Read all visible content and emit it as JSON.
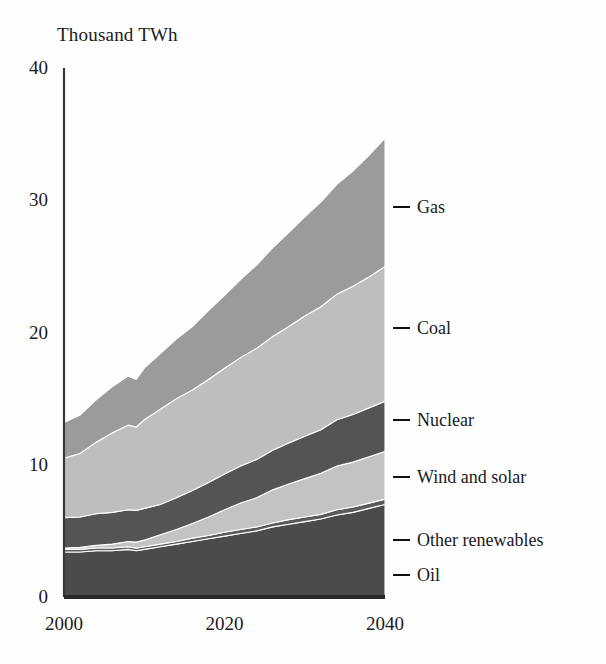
{
  "chart_data": {
    "type": "area",
    "title": "",
    "subtitle": "",
    "ylabel": "Thousand TWh",
    "xlabel": "",
    "ylim": [
      0,
      40
    ],
    "xlim": [
      2000,
      2040
    ],
    "yticks": [
      0,
      10,
      20,
      30,
      40
    ],
    "xticks": [
      2000,
      2020,
      2040
    ],
    "grid": false,
    "stacked": true,
    "legend_position": "right",
    "note": "Stacked area chart of world electricity generation by source, history and projection.",
    "x": [
      2000,
      2002,
      2004,
      2006,
      2008,
      2009,
      2010,
      2012,
      2014,
      2016,
      2018,
      2020,
      2022,
      2024,
      2026,
      2028,
      2030,
      2032,
      2034,
      2036,
      2038,
      2040
    ],
    "series": [
      {
        "name": "Oil",
        "color": "#4b4b4b",
        "values": [
          3.4,
          3.4,
          3.5,
          3.5,
          3.6,
          3.5,
          3.6,
          3.8,
          4.0,
          4.2,
          4.4,
          4.6,
          4.8,
          5.0,
          5.3,
          5.5,
          5.7,
          5.9,
          6.2,
          6.4,
          6.7,
          7.0
        ]
      },
      {
        "name": "Other renewables",
        "color": "#5a5a5a",
        "values": [
          0.2,
          0.2,
          0.2,
          0.2,
          0.2,
          0.2,
          0.2,
          0.2,
          0.2,
          0.25,
          0.25,
          0.3,
          0.3,
          0.3,
          0.3,
          0.35,
          0.35,
          0.35,
          0.4,
          0.4,
          0.4,
          0.4
        ]
      },
      {
        "name": "Wind and solar",
        "color": "#c3c3c3",
        "values": [
          0.1,
          0.15,
          0.2,
          0.3,
          0.4,
          0.45,
          0.5,
          0.7,
          0.9,
          1.1,
          1.4,
          1.7,
          2.0,
          2.2,
          2.5,
          2.7,
          2.9,
          3.1,
          3.3,
          3.4,
          3.5,
          3.6
        ]
      },
      {
        "name": "Nuclear",
        "color": "#545454",
        "values": [
          2.3,
          2.3,
          2.4,
          2.4,
          2.4,
          2.4,
          2.4,
          2.3,
          2.4,
          2.5,
          2.6,
          2.7,
          2.8,
          2.9,
          3.0,
          3.1,
          3.2,
          3.3,
          3.5,
          3.6,
          3.7,
          3.8
        ]
      },
      {
        "name": "Coal",
        "color": "#bebebe",
        "values": [
          4.5,
          4.8,
          5.4,
          6.0,
          6.4,
          6.3,
          6.7,
          7.2,
          7.5,
          7.6,
          7.8,
          8.0,
          8.2,
          8.4,
          8.6,
          8.8,
          9.1,
          9.3,
          9.5,
          9.7,
          9.9,
          10.2
        ]
      },
      {
        "name": "Gas",
        "color": "#9b9b9b",
        "values": [
          2.7,
          2.9,
          3.2,
          3.5,
          3.7,
          3.6,
          3.9,
          4.2,
          4.5,
          4.8,
          5.2,
          5.5,
          5.9,
          6.3,
          6.7,
          7.1,
          7.5,
          7.9,
          8.3,
          8.7,
          9.2,
          9.7
        ]
      }
    ]
  },
  "legend": {
    "items": [
      {
        "label": "Gas"
      },
      {
        "label": "Coal"
      },
      {
        "label": "Nuclear"
      },
      {
        "label": "Wind and solar"
      },
      {
        "label": "Other renewables"
      },
      {
        "label": "Oil"
      }
    ]
  }
}
